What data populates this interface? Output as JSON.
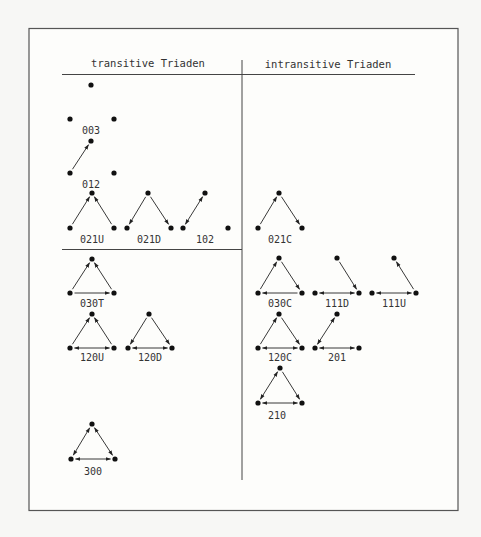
{
  "headers": {
    "left": "transitive Triaden",
    "right": "intransitive Triaden"
  },
  "colors": {
    "ink": "#222222",
    "frame": "#555555",
    "background": "#f7f7f5"
  },
  "triads": [
    {
      "id": "t003",
      "label": "003",
      "column": "transitive",
      "nodes": [
        [
          91,
          85
        ],
        [
          70,
          119
        ],
        [
          114,
          119
        ]
      ],
      "edges": [],
      "labelPos": [
        91,
        134
      ]
    },
    {
      "id": "t012",
      "label": "012",
      "column": "transitive",
      "nodes": [
        [
          91,
          141
        ],
        [
          70,
          173
        ],
        [
          114,
          173
        ]
      ],
      "edges": [
        {
          "from": 1,
          "to": 0
        }
      ],
      "labelPos": [
        91,
        188
      ]
    },
    {
      "id": "t021U",
      "label": "021U",
      "column": "transitive",
      "nodes": [
        [
          92,
          193
        ],
        [
          70,
          228
        ],
        [
          114,
          228
        ]
      ],
      "edges": [
        {
          "from": 1,
          "to": 0
        },
        {
          "from": 2,
          "to": 0
        }
      ],
      "labelPos": [
        92,
        243
      ]
    },
    {
      "id": "t021D",
      "label": "021D",
      "column": "transitive",
      "nodes": [
        [
          148,
          193
        ],
        [
          127,
          228
        ],
        [
          171,
          228
        ]
      ],
      "edges": [
        {
          "from": 0,
          "to": 1
        },
        {
          "from": 0,
          "to": 2
        }
      ],
      "labelPos": [
        149,
        243
      ]
    },
    {
      "id": "t102",
      "label": "102",
      "column": "transitive",
      "nodes": [
        [
          205,
          193
        ],
        [
          183,
          228
        ],
        [
          228,
          228
        ]
      ],
      "edges": [
        {
          "from": 1,
          "to": 0,
          "both": true
        }
      ],
      "labelPos": [
        205,
        243
      ]
    },
    {
      "id": "t030T",
      "label": "030T",
      "column": "transitive",
      "nodes": [
        [
          92,
          259
        ],
        [
          70,
          293
        ],
        [
          114,
          293
        ]
      ],
      "edges": [
        {
          "from": 1,
          "to": 0
        },
        {
          "from": 2,
          "to": 0
        },
        {
          "from": 1,
          "to": 2
        }
      ],
      "labelPos": [
        92,
        307
      ]
    },
    {
      "id": "t120U",
      "label": "120U",
      "column": "transitive",
      "nodes": [
        [
          92,
          314
        ],
        [
          70,
          348
        ],
        [
          114,
          348
        ]
      ],
      "edges": [
        {
          "from": 1,
          "to": 0
        },
        {
          "from": 2,
          "to": 0
        },
        {
          "from": 1,
          "to": 2,
          "both": true
        }
      ],
      "labelPos": [
        92,
        361
      ]
    },
    {
      "id": "t120D",
      "label": "120D",
      "column": "transitive",
      "nodes": [
        [
          149,
          314
        ],
        [
          128,
          348
        ],
        [
          172,
          348
        ]
      ],
      "edges": [
        {
          "from": 0,
          "to": 1
        },
        {
          "from": 0,
          "to": 2
        },
        {
          "from": 1,
          "to": 2,
          "both": true
        }
      ],
      "labelPos": [
        150,
        361
      ]
    },
    {
      "id": "t300",
      "label": "300",
      "column": "transitive",
      "nodes": [
        [
          92,
          424
        ],
        [
          71,
          459
        ],
        [
          115,
          459
        ]
      ],
      "edges": [
        {
          "from": 1,
          "to": 0,
          "both": true
        },
        {
          "from": 2,
          "to": 0,
          "both": true
        },
        {
          "from": 1,
          "to": 2,
          "both": true
        }
      ],
      "labelPos": [
        93,
        475
      ]
    },
    {
      "id": "t021C",
      "label": "021C",
      "column": "intransitive",
      "nodes": [
        [
          279,
          193
        ],
        [
          258,
          228
        ],
        [
          302,
          228
        ]
      ],
      "edges": [
        {
          "from": 1,
          "to": 0
        },
        {
          "from": 0,
          "to": 2
        }
      ],
      "labelPos": [
        280,
        243
      ]
    },
    {
      "id": "t030C",
      "label": "030C",
      "column": "intransitive",
      "nodes": [
        [
          279,
          258
        ],
        [
          258,
          293
        ],
        [
          302,
          293
        ]
      ],
      "edges": [
        {
          "from": 1,
          "to": 0
        },
        {
          "from": 0,
          "to": 2
        },
        {
          "from": 2,
          "to": 1
        }
      ],
      "labelPos": [
        280,
        307
      ]
    },
    {
      "id": "t111D",
      "label": "111D",
      "column": "intransitive",
      "nodes": [
        [
          337,
          258
        ],
        [
          315,
          293
        ],
        [
          359,
          293
        ]
      ],
      "edges": [
        {
          "from": 0,
          "to": 2
        },
        {
          "from": 1,
          "to": 2,
          "both": true
        }
      ],
      "labelPos": [
        337,
        307
      ]
    },
    {
      "id": "t111U",
      "label": "111U",
      "column": "intransitive",
      "nodes": [
        [
          394,
          258
        ],
        [
          372,
          293
        ],
        [
          416,
          293
        ]
      ],
      "edges": [
        {
          "from": 2,
          "to": 0
        },
        {
          "from": 1,
          "to": 2,
          "both": true
        }
      ],
      "labelPos": [
        394,
        307
      ]
    },
    {
      "id": "t120C",
      "label": "120C",
      "column": "intransitive",
      "nodes": [
        [
          279,
          314
        ],
        [
          258,
          348
        ],
        [
          302,
          348
        ]
      ],
      "edges": [
        {
          "from": 1,
          "to": 0
        },
        {
          "from": 0,
          "to": 2
        },
        {
          "from": 1,
          "to": 2,
          "both": true
        }
      ],
      "labelPos": [
        280,
        361
      ]
    },
    {
      "id": "t201",
      "label": "201",
      "column": "intransitive",
      "nodes": [
        [
          337,
          314
        ],
        [
          315,
          348
        ],
        [
          359,
          348
        ]
      ],
      "edges": [
        {
          "from": 0,
          "to": 1,
          "both": true
        },
        {
          "from": 1,
          "to": 2,
          "both": true
        }
      ],
      "labelPos": [
        337,
        361
      ]
    },
    {
      "id": "t210",
      "label": "210",
      "column": "intransitive",
      "nodes": [
        [
          280,
          368
        ],
        [
          258,
          403
        ],
        [
          302,
          403
        ]
      ],
      "edges": [
        {
          "from": 1,
          "to": 0,
          "both": true
        },
        {
          "from": 0,
          "to": 2
        },
        {
          "from": 1,
          "to": 2,
          "both": true
        }
      ],
      "labelPos": [
        277,
        419
      ]
    }
  ]
}
